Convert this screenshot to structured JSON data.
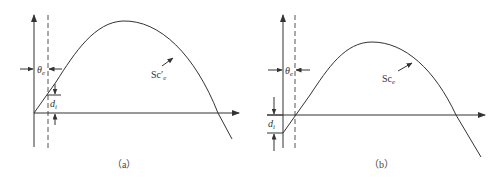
{
  "figure": {
    "panels": [
      {
        "id": "a",
        "caption": "（a）",
        "theta_label": "θ",
        "theta_sub": "e",
        "curve_label": "Sc",
        "curve_prime": "′",
        "curve_sub": "e",
        "offset_label": "d",
        "offset_sub": "i",
        "offset_direction": "curve starts at origin; d_i measured above x-axis at dashed line"
      },
      {
        "id": "b",
        "caption": "（b）",
        "theta_label": "θ",
        "theta_sub": "e",
        "curve_label": "Sc",
        "curve_prime": "",
        "curve_sub": "e",
        "offset_label": "d",
        "offset_sub": "i",
        "offset_direction": "curve starts below origin by d_i; crosses x-axis at dashed line"
      }
    ],
    "colors": {
      "line": "#333333",
      "background": "#ffffff",
      "dashed": "#555555"
    }
  }
}
